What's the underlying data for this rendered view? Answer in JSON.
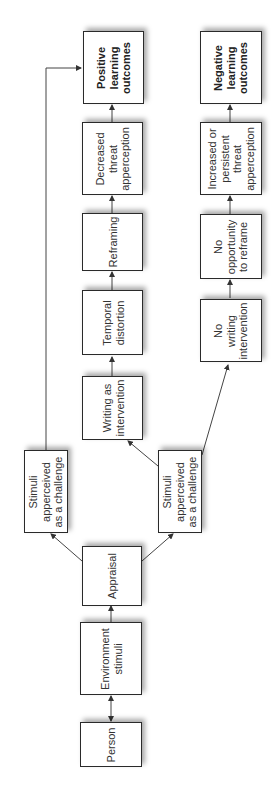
{
  "diagram": {
    "orientation": "rotated -90deg (reads bottom-to-top)",
    "colors": {
      "box_border": "#2a2a2a",
      "text": "#333333",
      "line": "#444444",
      "background": "#ffffff"
    },
    "nodes": {
      "person": {
        "label": "Person"
      },
      "environment_stimuli": {
        "label": "Environment\nstimuli"
      },
      "appraisal": {
        "label": "Appraisal"
      },
      "stimuli_challenge_upper": {
        "label": "Stimuli\napperceived\nas a challenge"
      },
      "stimuli_challenge_lower": {
        "label": "Stimuli\napperceived\nas a challenge"
      },
      "writing_intervention": {
        "label": "Writing as\nintervention"
      },
      "temporal_distortion": {
        "label": "Temporal\ndistortion"
      },
      "reframing": {
        "label": "Reframing"
      },
      "decreased_threat": {
        "label": "Decreased\nthreat\napperception"
      },
      "positive_outcomes": {
        "label": "Positive\nlearning\noutcomes"
      },
      "no_writing": {
        "label": "No\nwriting\nintervention"
      },
      "no_reframe": {
        "label": "No\nopportunity\nto reframe"
      },
      "increased_threat": {
        "label": "Increased or\npersistent\nthreat\napperception"
      },
      "negative_outcomes": {
        "label": "Negative\nlearning\noutcomes"
      }
    },
    "edges": [
      {
        "from": "person",
        "to": "environment_stimuli",
        "type": "bidirectional"
      },
      {
        "from": "environment_stimuli",
        "to": "appraisal"
      },
      {
        "from": "appraisal",
        "to": "stimuli_challenge_upper"
      },
      {
        "from": "appraisal",
        "to": "stimuli_challenge_lower"
      },
      {
        "from": "stimuli_challenge_upper",
        "to": "positive_outcomes"
      },
      {
        "from": "stimuli_challenge_lower",
        "to": "writing_intervention"
      },
      {
        "from": "writing_intervention",
        "to": "temporal_distortion"
      },
      {
        "from": "temporal_distortion",
        "to": "reframing"
      },
      {
        "from": "reframing",
        "to": "decreased_threat"
      },
      {
        "from": "decreased_threat",
        "to": "positive_outcomes"
      },
      {
        "from": "stimuli_challenge_lower",
        "to": "no_writing"
      },
      {
        "from": "no_writing",
        "to": "no_reframe"
      },
      {
        "from": "no_reframe",
        "to": "increased_threat"
      },
      {
        "from": "increased_threat",
        "to": "negative_outcomes"
      }
    ]
  }
}
